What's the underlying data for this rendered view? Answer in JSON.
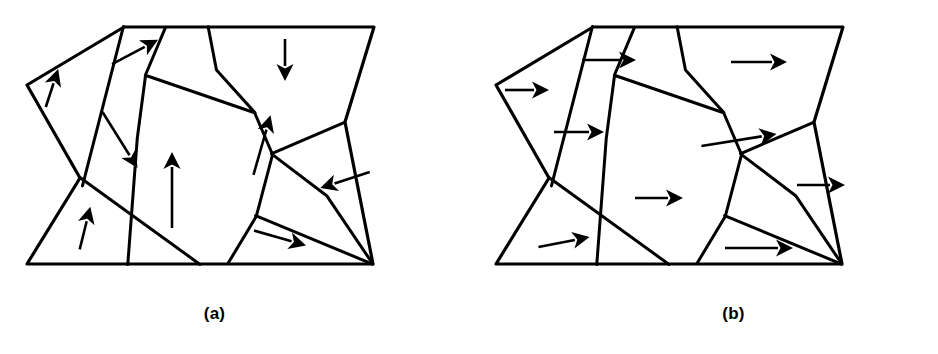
{
  "figure": {
    "background_color": "#ffffff",
    "line_color": "#000000",
    "fill_color": "#ffffff"
  },
  "panels": [
    {
      "id": "a",
      "caption": "(a)",
      "description": "Polycrystalline grain structure with randomly oriented magnetization vectors (demagnetized state)",
      "grain_count": 9,
      "arrow_count": 9
    },
    {
      "id": "b",
      "caption": "(b)",
      "description": "Same polycrystalline grain structure with all magnetization vectors aligned to the right (saturated state)",
      "grain_count": 9,
      "arrow_count": 9
    }
  ],
  "chart_data": {
    "type": "diagram",
    "title": "",
    "subtitle": "",
    "diagram_kind": "polycrystalline-grain-magnetic-domain-schematic",
    "panel_labels": [
      "(a)",
      "(b)"
    ],
    "shared_outline": [
      [
        124,
        27
      ],
      [
        374,
        27
      ],
      [
        345,
        122
      ],
      [
        373,
        264
      ],
      [
        27,
        264
      ],
      [
        80,
        178
      ],
      [
        27,
        85
      ]
    ],
    "shared_boundaries": [
      [
        [
          124,
          27
        ],
        [
          82,
          186
        ]
      ],
      [
        [
          165,
          27
        ],
        [
          145,
          75
        ],
        [
          255,
          113
        ],
        [
          272,
          154
        ],
        [
          256,
          216
        ],
        [
          228,
          264
        ]
      ],
      [
        [
          80,
          178
        ],
        [
          200,
          264
        ]
      ],
      [
        [
          145,
          75
        ],
        [
          137,
          139
        ],
        [
          128,
          264
        ]
      ],
      [
        [
          208,
          27
        ],
        [
          216,
          70
        ],
        [
          255,
          113
        ]
      ],
      [
        [
          272,
          154
        ],
        [
          345,
          122
        ]
      ],
      [
        [
          256,
          216
        ],
        [
          373,
          264
        ]
      ],
      [
        [
          272,
          154
        ],
        [
          327,
          196
        ],
        [
          373,
          264
        ]
      ]
    ],
    "panel_a_vectors": [
      {
        "grain": "upper-left-sliver",
        "x": 52,
        "y": 88,
        "angle_deg": 72,
        "length": 40,
        "label": "up-right steep"
      },
      {
        "grain": "top-center",
        "x": 135,
        "y": 52,
        "angle_deg": 28,
        "length": 52,
        "label": "up-right shallow"
      },
      {
        "grain": "top-right",
        "x": 285,
        "y": 60,
        "angle_deg": -90,
        "length": 42,
        "label": "down"
      },
      {
        "grain": "upper-mid-left",
        "x": 120,
        "y": 140,
        "angle_deg": -58,
        "length": 66,
        "label": "down-right"
      },
      {
        "grain": "center-column",
        "x": 172,
        "y": 190,
        "angle_deg": 90,
        "length": 76,
        "label": "up"
      },
      {
        "grain": "center-right",
        "x": 262,
        "y": 145,
        "angle_deg": 74,
        "length": 62,
        "label": "up slightly left"
      },
      {
        "grain": "right-lobe",
        "x": 345,
        "y": 180,
        "angle_deg": 198,
        "length": 52,
        "label": "left slightly down"
      },
      {
        "grain": "bottom-left",
        "x": 85,
        "y": 228,
        "angle_deg": 76,
        "length": 44,
        "label": "up slightly right"
      },
      {
        "grain": "bottom-center",
        "x": 280,
        "y": 238,
        "angle_deg": -16,
        "length": 54,
        "label": "right slightly down"
      }
    ],
    "panel_b_vectors": [
      {
        "grain": "upper-left-sliver",
        "x": 58,
        "y": 90,
        "angle_deg": 0,
        "length": 44,
        "label": "right"
      },
      {
        "grain": "top-center",
        "x": 140,
        "y": 60,
        "angle_deg": 0,
        "length": 54,
        "label": "right"
      },
      {
        "grain": "top-right",
        "x": 290,
        "y": 62,
        "angle_deg": 0,
        "length": 56,
        "label": "right"
      },
      {
        "grain": "upper-mid-left",
        "x": 110,
        "y": 132,
        "angle_deg": 0,
        "length": 50,
        "label": "right"
      },
      {
        "grain": "center-right",
        "x": 270,
        "y": 140,
        "angle_deg": 9,
        "length": 76,
        "label": "right slightly up"
      },
      {
        "grain": "center-column",
        "x": 190,
        "y": 198,
        "angle_deg": 0,
        "length": 48,
        "label": "right"
      },
      {
        "grain": "right-lobe",
        "x": 352,
        "y": 185,
        "angle_deg": 0,
        "length": 48,
        "label": "right"
      },
      {
        "grain": "bottom-left",
        "x": 95,
        "y": 242,
        "angle_deg": 11,
        "length": 52,
        "label": "right slightly up"
      },
      {
        "grain": "bottom-center",
        "x": 290,
        "y": 248,
        "angle_deg": 0,
        "length": 68,
        "label": "right"
      }
    ]
  }
}
